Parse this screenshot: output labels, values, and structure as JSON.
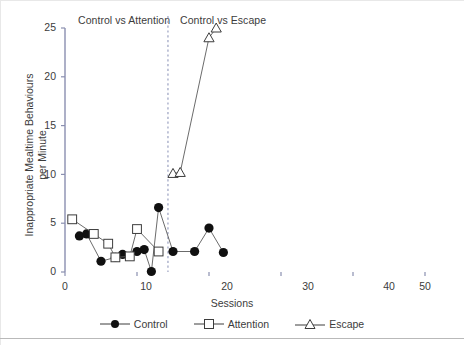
{
  "chart_data": {
    "type": "line",
    "title": "",
    "panel_titles": [
      "Control vs Attention",
      "Control vs Escape"
    ],
    "xlabel": "Sessions",
    "ylabel_lines": [
      "Inappropriate Mealtime Behaviours",
      "per Minute"
    ],
    "xlim": [
      0,
      50
    ],
    "ylim": [
      0,
      25
    ],
    "xticks": [
      0,
      10,
      20,
      30,
      40,
      50
    ],
    "yticks": [
      0,
      5,
      10,
      15,
      20,
      25
    ],
    "grid": false,
    "legend_position": "bottom-center",
    "phase_change_line_x": 14.3,
    "series": [
      {
        "name": "Control",
        "marker": "filled-circle",
        "color": "#101010",
        "points": [
          {
            "x": 2,
            "y": 3.7
          },
          {
            "x": 3,
            "y": 3.9
          },
          {
            "x": 5,
            "y": 1.1
          },
          {
            "x": 7,
            "y": 1.5
          },
          {
            "x": 8,
            "y": 1.8
          },
          {
            "x": 10,
            "y": 2.1
          },
          {
            "x": 11,
            "y": 2.3
          },
          {
            "x": 12,
            "y": 0.05
          },
          {
            "x": 13,
            "y": 6.6
          },
          {
            "x": 15,
            "y": 2.1
          },
          {
            "x": 18,
            "y": 2.1
          },
          {
            "x": 20,
            "y": 4.5
          },
          {
            "x": 22,
            "y": 2.0
          }
        ]
      },
      {
        "name": "Attention",
        "marker": "open-square",
        "color": "#3c3c3c",
        "points": [
          {
            "x": 1,
            "y": 5.4
          },
          {
            "x": 4,
            "y": 3.9
          },
          {
            "x": 6,
            "y": 2.9
          },
          {
            "x": 7,
            "y": 1.5
          },
          {
            "x": 9,
            "y": 1.6
          },
          {
            "x": 10,
            "y": 4.4
          },
          {
            "x": 13,
            "y": 2.1
          }
        ]
      },
      {
        "name": "Escape",
        "marker": "open-triangle",
        "color": "#3c3c3c",
        "points": [
          {
            "x": 15,
            "y": 10.1
          },
          {
            "x": 16,
            "y": 10.2
          },
          {
            "x": 20,
            "y": 24.0
          },
          {
            "x": 21,
            "y": 25.0
          }
        ]
      }
    ]
  },
  "legend": {
    "items": [
      {
        "label": "Control",
        "marker": "filled-circle"
      },
      {
        "label": "Attention",
        "marker": "open-square"
      },
      {
        "label": "Escape",
        "marker": "open-triangle"
      }
    ]
  },
  "colors": {
    "axis": "#8a8fb0",
    "text": "#3c3c3c",
    "marker_dark": "#101010",
    "marker_open": "#3c3c3c",
    "phase_line": "#9aa0c0"
  }
}
